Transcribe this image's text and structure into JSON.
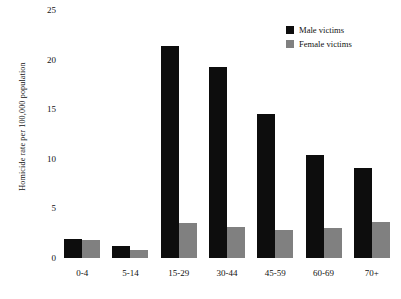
{
  "chart_data": {
    "type": "bar",
    "title": "",
    "subtitle": "",
    "xlabel": "",
    "ylabel": "Homicide rate per 100,000 population",
    "categories": [
      "0-4",
      "5-14",
      "15-29",
      "30-44",
      "45-59",
      "60-69",
      "70+"
    ],
    "series": [
      {
        "name": "Male victims",
        "color": "#0d0d0d",
        "values": [
          1.9,
          1.2,
          21.4,
          19.3,
          14.5,
          10.4,
          9.1
        ]
      },
      {
        "name": "Female victims",
        "color": "#808080",
        "values": [
          1.8,
          0.8,
          3.5,
          3.1,
          2.8,
          3.0,
          3.6
        ]
      }
    ],
    "ylim": [
      0,
      25
    ],
    "ytick_labels": [
      "0",
      "5",
      "10",
      "15",
      "20",
      "25"
    ],
    "ytick_values": [
      0,
      5,
      10,
      15,
      20,
      25
    ],
    "grid": false,
    "legend_position": "top-right"
  },
  "legend": {
    "entries": [
      {
        "label": "Male victims",
        "color": "#0d0d0d"
      },
      {
        "label": "Female victims",
        "color": "#808080"
      }
    ]
  }
}
